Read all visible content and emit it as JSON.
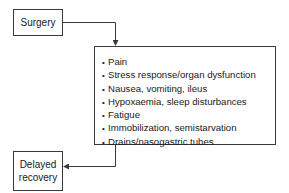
{
  "diagram": {
    "start_node": {
      "label": "Surgery"
    },
    "factors_node": {
      "bullet": "•",
      "items": [
        "Pain",
        "Stress response/organ dysfunction",
        "Nausea, vomiting, ileus",
        "Hypoxaemia, sleep disturbances",
        "Fatigue",
        "Immobilization, semistarvation",
        "Drains/nasogastric tubes"
      ]
    },
    "end_node": {
      "line1": "Delayed",
      "line2": "recovery"
    },
    "colors": {
      "line": "#3a3a3a",
      "text": "#1a1a1a",
      "background": "#ffffff"
    }
  }
}
